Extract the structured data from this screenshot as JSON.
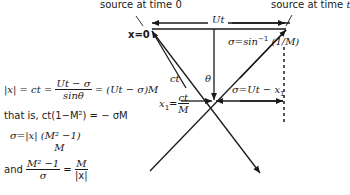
{
  "labels": {
    "source_time0": "source at time 0",
    "source_timet": "source at time t",
    "x_zero": "x=0",
    "Ut": "Ut",
    "sigma_arcsin_left": "σ=sin",
    "sigma_arcsin_exp": "−1",
    "sigma_arcsin_right": "(1/M)",
    "ct": "ct",
    "theta": "θ",
    "sigma_Ut_x1": "σ=Ut − x",
    "sigma_Ut_x1_sub": "1",
    "x1_lhs": "x",
    "x1_sub": "1",
    "x1_eq": "=",
    "x1_num": "ct",
    "x1_den": "M"
  },
  "equations": {
    "eq1_lhs": "|x| = ct = ",
    "eq1_num": "Ut − σ",
    "eq1_den": "sinθ",
    "eq1_rhs": " = (Ut − σ)M",
    "eq2": "that is, ct(1−M²) = − σM",
    "eq3_lhs": "σ=|x| (M² −1)",
    "eq3_den": "M",
    "eq4_prefix": "and ",
    "eq4_num": "M² −1",
    "eq4_den": "σ",
    "eq4_eq": " = ",
    "eq4_rnum": "M",
    "eq4_rden": "|x|"
  },
  "colors": {
    "ink": "#1a1a1a",
    "background": "#ffffff"
  }
}
